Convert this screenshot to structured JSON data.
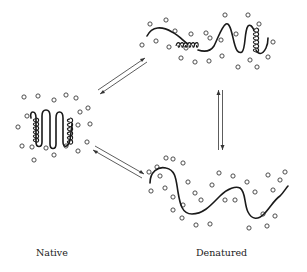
{
  "states": [
    {
      "id": "native",
      "label": "Native",
      "description": "compact folded chain with helices surrounded by solvent molecules"
    },
    {
      "id": "denatured-partial",
      "label": "",
      "description": "partially unfolded chain with residual helices"
    },
    {
      "id": "denatured-random",
      "label": "",
      "description": "random-coil chain with solvent molecules interpenetrating"
    }
  ],
  "labels": {
    "native": "Native",
    "denatured": "Denatured"
  },
  "equilibria": [
    {
      "from": "native",
      "to": "denatured-partial",
      "symbol": "equilibrium-arrows"
    },
    {
      "from": "native",
      "to": "denatured-random",
      "symbol": "equilibrium-arrows"
    },
    {
      "from": "denatured-partial",
      "to": "denatured-random",
      "symbol": "equilibrium-arrows"
    }
  ],
  "colors": {
    "ink": "#1a1a1a",
    "background": "#ffffff"
  }
}
